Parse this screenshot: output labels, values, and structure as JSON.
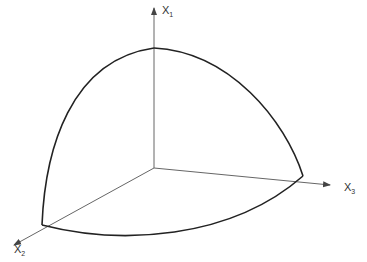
{
  "diagram": {
    "axes": [
      {
        "name": "x1",
        "label": "X",
        "subscript": "1"
      },
      {
        "name": "x2",
        "label": "X",
        "subscript": "2"
      },
      {
        "name": "x3",
        "label": "X",
        "subscript": "3"
      }
    ],
    "colors": {
      "axis": "#555555",
      "curve": "#222222"
    }
  }
}
